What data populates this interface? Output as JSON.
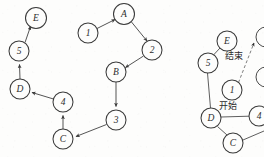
{
  "page": {
    "width": 264,
    "height": 157,
    "background_color": "#fdfdfc",
    "ink_color": "#3a3a3a"
  },
  "diagrams": [
    {
      "id": "left-directed-graph",
      "name": "directed-cycle-graph",
      "directed": true,
      "nodes": [
        {
          "id": "E",
          "label": "E",
          "x": 36,
          "y": 18,
          "r": 10.5
        },
        {
          "id": "L5",
          "label": "5",
          "x": 19,
          "y": 51,
          "r": 10.0
        },
        {
          "id": "D",
          "label": "D",
          "x": 20,
          "y": 89,
          "r": 10.0
        },
        {
          "id": "L4",
          "label": "4",
          "x": 63,
          "y": 102,
          "r": 10.0
        },
        {
          "id": "C",
          "label": "C",
          "x": 63,
          "y": 139,
          "r": 10.0
        },
        {
          "id": "L3",
          "label": "3",
          "x": 116,
          "y": 120,
          "r": 10.0
        },
        {
          "id": "B",
          "label": "B",
          "x": 116,
          "y": 72,
          "r": 10.0
        },
        {
          "id": "L2",
          "label": "2",
          "x": 152,
          "y": 50,
          "r": 10.0
        },
        {
          "id": "A",
          "label": "A",
          "x": 124,
          "y": 14,
          "r": 10.5
        },
        {
          "id": "L1",
          "label": "1",
          "x": 88,
          "y": 33,
          "r": 10.0
        }
      ],
      "edges": [
        {
          "from": "L1",
          "to": "A",
          "style": "solid",
          "arrow": true
        },
        {
          "from": "A",
          "to": "L2",
          "style": "solid",
          "arrow": true
        },
        {
          "from": "L2",
          "to": "B",
          "style": "solid",
          "arrow": true
        },
        {
          "from": "B",
          "to": "L3",
          "style": "solid",
          "arrow": true
        },
        {
          "from": "L3",
          "to": "C",
          "style": "solid",
          "arrow": true
        },
        {
          "from": "C",
          "to": "L4",
          "style": "solid",
          "arrow": true
        },
        {
          "from": "L4",
          "to": "D",
          "style": "solid",
          "arrow": true
        },
        {
          "from": "D",
          "to": "L5",
          "style": "solid",
          "arrow": true
        },
        {
          "from": "L5",
          "to": "E",
          "style": "solid",
          "arrow": true
        }
      ]
    },
    {
      "id": "right-undirected-graph",
      "name": "annotated-graph-cropped",
      "directed": false,
      "cropped_at_right_edge": true,
      "nodes": [
        {
          "id": "RE",
          "label": "E",
          "x": 227,
          "y": 41,
          "r": 10.0
        },
        {
          "id": "R5",
          "label": "5",
          "x": 208,
          "y": 63,
          "r": 10.0
        },
        {
          "id": "R1",
          "label": "1",
          "x": 232,
          "y": 90,
          "r": 10.0
        },
        {
          "id": "RD",
          "label": "D",
          "x": 211,
          "y": 118,
          "r": 10.0
        },
        {
          "id": "R4",
          "label": "4",
          "x": 259,
          "y": 116,
          "r": 10.0
        },
        {
          "id": "RC",
          "label": "C",
          "x": 233,
          "y": 143,
          "r": 10.0
        }
      ],
      "clipped_nodes": [
        {
          "id": "RX1",
          "x": 266,
          "y": 37,
          "r": 10.0
        },
        {
          "id": "RX2",
          "x": 266,
          "y": 77,
          "r": 10.0
        }
      ],
      "edges": [
        {
          "from": "RE",
          "to": "R5",
          "style": "solid",
          "arrow": false
        },
        {
          "from": "R5",
          "to": "RD",
          "style": "solid",
          "arrow": false
        },
        {
          "from": "RD",
          "to": "R4",
          "style": "solid",
          "arrow": false
        },
        {
          "from": "RD",
          "to": "RC",
          "style": "solid",
          "arrow": false
        },
        {
          "from": "RC",
          "to": "edge-right",
          "style": "solid",
          "arrow": false
        },
        {
          "from": "R1",
          "to": "RX1",
          "style": "dashed",
          "arrow": true
        }
      ],
      "annotations": [
        {
          "id": "end-label",
          "text": "结束",
          "x": 234,
          "y": 56,
          "meaning": "end"
        },
        {
          "id": "start-label",
          "text": "开始",
          "x": 228,
          "y": 106,
          "meaning": "start"
        }
      ]
    }
  ]
}
